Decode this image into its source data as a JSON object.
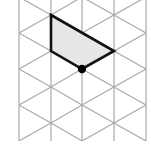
{
  "diagram": {
    "type": "isometric-dot-grid",
    "background": "#ffffff",
    "grid_color": "#a9a9a9",
    "columns_x": [
      19,
      51,
      82,
      114,
      146
    ],
    "clip": {
      "top": 0,
      "bottom": 141
    },
    "row_spacing": 36,
    "even_column_node_y": [
      -3,
      33,
      69,
      105,
      141
    ],
    "odd_column_node_y": [
      15,
      51,
      87,
      123
    ],
    "shape": {
      "name": "trapezium",
      "fill": "#e6e6e6",
      "stroke": "#111111",
      "stroke_width": 2.6,
      "vertices": [
        [
          51,
          15
        ],
        [
          114,
          51
        ],
        [
          82,
          69
        ],
        [
          51,
          51
        ]
      ]
    },
    "highlight_point": {
      "x": 82,
      "y": 69,
      "r": 4.2,
      "color": "#000000"
    }
  }
}
